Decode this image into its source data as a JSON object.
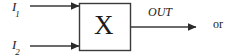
{
  "figure": {
    "type": "block-diagram",
    "background_color": "#ffffff",
    "line_color": "#3a3a3a",
    "text_color": "#1a1a1a"
  },
  "inputs": [
    {
      "id": "i1",
      "base": "I",
      "subscript": "1",
      "y": 6
    },
    {
      "id": "i2",
      "base": "I",
      "subscript": "2",
      "y": 46
    }
  ],
  "block": {
    "label": "X",
    "x": 79,
    "y": 3,
    "width": 51,
    "height": 47,
    "border_color": "#3a3a3a",
    "fill": "#ffffff"
  },
  "output": {
    "label": "OUT",
    "y": 27
  },
  "trailing_text": {
    "label": "or"
  }
}
